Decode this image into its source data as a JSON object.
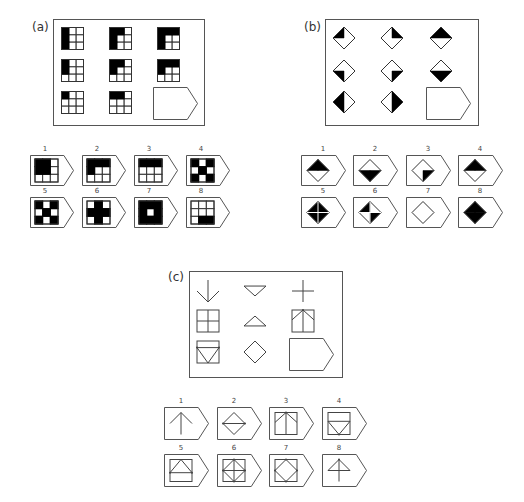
{
  "panels": [
    {
      "id": "a",
      "label": "(a)",
      "type": "grid-3x3",
      "matrix": [
        [
          {
            "black": [
              0,
              3,
              6
            ]
          },
          {
            "black": [
              0,
              1,
              3,
              6
            ]
          },
          {
            "black": [
              0,
              1,
              2,
              3,
              6
            ]
          }
        ],
        [
          {
            "black": [
              0,
              3
            ]
          },
          {
            "black": [
              0,
              1,
              3
            ]
          },
          {
            "black": [
              0,
              1,
              2,
              3
            ]
          }
        ],
        [
          {
            "black": [
              0
            ]
          },
          {
            "black": [
              0,
              1
            ]
          },
          {
            "answer_slot": true
          }
        ]
      ],
      "options": [
        {
          "num": "1",
          "black": [
            0,
            1,
            3,
            4
          ]
        },
        {
          "num": "2",
          "black": [
            0,
            1,
            2,
            3
          ]
        },
        {
          "num": "3",
          "black": [
            0,
            1,
            2
          ]
        },
        {
          "num": "4",
          "black": [
            0,
            2,
            4,
            6,
            8
          ]
        },
        {
          "num": "5",
          "black": [
            0,
            2,
            4,
            6,
            8
          ]
        },
        {
          "num": "6",
          "black": [
            1,
            3,
            4,
            5,
            7
          ]
        },
        {
          "num": "7",
          "black": [
            0,
            1,
            2,
            3,
            5,
            6,
            7,
            8
          ],
          "solid_inner": true
        },
        {
          "num": "8",
          "black": [
            7,
            8
          ]
        }
      ]
    },
    {
      "id": "b",
      "label": "(b)",
      "type": "diamond",
      "matrix": [
        [
          {
            "fill": [
              "tl"
            ]
          },
          {
            "fill": [
              "tr"
            ]
          },
          {
            "fill": [
              "tl",
              "tr"
            ]
          }
        ],
        [
          {
            "fill": [
              "bl"
            ]
          },
          {
            "fill": [
              "br"
            ]
          },
          {
            "fill": [
              "bl",
              "br"
            ]
          }
        ],
        [
          {
            "fill": [
              "tl",
              "bl"
            ]
          },
          {
            "fill": [
              "tr",
              "br"
            ]
          },
          {
            "answer_slot": true
          }
        ]
      ],
      "options": [
        {
          "num": "1",
          "fill": [
            "tl",
            "tr"
          ]
        },
        {
          "num": "2",
          "fill": [
            "bl",
            "br"
          ]
        },
        {
          "num": "3",
          "fill": [
            "br"
          ]
        },
        {
          "num": "4",
          "fill": [
            "tl",
            "tr"
          ]
        },
        {
          "num": "5",
          "fill": [
            "tl",
            "tr",
            "bl",
            "br"
          ],
          "cross": true
        },
        {
          "num": "6",
          "fill": [
            "tl",
            "br"
          ],
          "cross": true
        },
        {
          "num": "7",
          "fill": []
        },
        {
          "num": "8",
          "fill": [
            "tl",
            "tr",
            "bl",
            "br"
          ]
        }
      ]
    },
    {
      "id": "c",
      "label": "(c)",
      "type": "line-figures",
      "matrix": [
        [
          "arrow-down",
          "triangle-down",
          "plus"
        ],
        [
          "square-quartered",
          "triangle-up",
          "square-arrow-up"
        ],
        [
          "square-triangle-down",
          "diamond",
          "answer-slot"
        ]
      ],
      "options": [
        {
          "num": "1",
          "figure": "arrow-up"
        },
        {
          "num": "2",
          "figure": "diamond-hline"
        },
        {
          "num": "3",
          "figure": "square-arrow-up"
        },
        {
          "num": "4",
          "figure": "square-hline-triangle-down"
        },
        {
          "num": "5",
          "figure": "square-hline-triangle-up"
        },
        {
          "num": "6",
          "figure": "square-diamond-cross"
        },
        {
          "num": "7",
          "figure": "square-diamond"
        },
        {
          "num": "8",
          "figure": "arrow-up-triangle"
        }
      ]
    }
  ],
  "colors": {
    "stroke": "#444444",
    "fill": "#000000",
    "frame": "#555555"
  }
}
